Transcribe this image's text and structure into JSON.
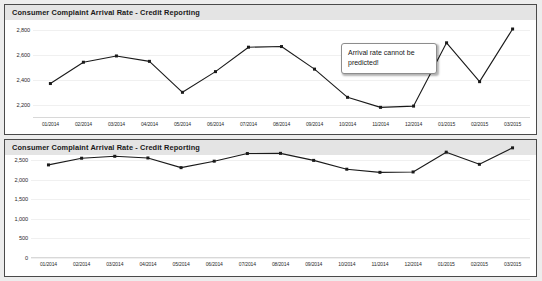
{
  "chart_data": [
    {
      "type": "line",
      "title": "Consumer Complaint Arrival Rate - Credit Reporting",
      "xlabel": "",
      "ylabel": "",
      "ylim": [
        2100,
        2850
      ],
      "yticks": [
        "2,800",
        "2,600",
        "2,400",
        "2,200"
      ],
      "ytick_values": [
        2800,
        2600,
        2400,
        2200
      ],
      "grid": true,
      "legend": "none",
      "categories": [
        "01/2014",
        "02/2014",
        "03/2014",
        "04/2014",
        "05/2014",
        "06/2014",
        "07/2014",
        "08/2014",
        "09/2014",
        "10/2014",
        "11/2014",
        "12/2014",
        "01/2015",
        "02/2015",
        "03/2015"
      ],
      "values": [
        2375,
        2545,
        2595,
        2552,
        2305,
        2470,
        2665,
        2670,
        2490,
        2265,
        2185,
        2195,
        2700,
        2390,
        2810
      ],
      "annotation": "Arrival rate cannot be predicted!"
    },
    {
      "type": "line",
      "title": "Consumer Complaint Arrival Rate - Credit Reporting",
      "xlabel": "",
      "ylabel": "",
      "ylim": [
        0,
        2500
      ],
      "yticks": [
        "2,500",
        "2,000",
        "1,500",
        "1,000",
        "500",
        "0"
      ],
      "ytick_values": [
        2500,
        2000,
        1500,
        1000,
        500,
        0
      ],
      "grid": true,
      "legend": "none",
      "categories": [
        "01/2014",
        "02/2014",
        "03/2014",
        "04/2014",
        "05/2014",
        "06/2014",
        "07/2014",
        "08/2014",
        "09/2014",
        "10/2014",
        "11/2014",
        "12/2014",
        "01/2015",
        "02/2015",
        "03/2015"
      ],
      "values": [
        2375,
        2545,
        2595,
        2552,
        2305,
        2470,
        2665,
        2670,
        2490,
        2265,
        2185,
        2195,
        2700,
        2390,
        2810
      ],
      "annotation": "Does complaint arrival rate averages 2,300 per month sound more reasonable"
    }
  ],
  "colors": {
    "line": "#1a1a1a",
    "panel_border": "#4a4a4a",
    "title_band": "#e4e4e4",
    "page_background": "#ededed",
    "gridline": "#f0f0f0"
  }
}
